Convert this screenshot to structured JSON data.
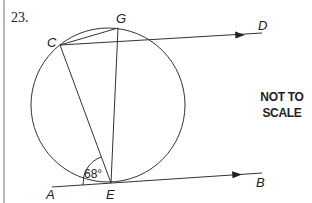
{
  "question": {
    "number": "23.",
    "note_line1": "NOT TO",
    "note_line2": "SCALE"
  },
  "diagram": {
    "circle": {
      "cx": 108,
      "cy": 105,
      "r": 77
    },
    "points": {
      "C": {
        "label": "C",
        "x": 60,
        "y": 45
      },
      "G": {
        "label": "G",
        "x": 118,
        "y": 28
      },
      "D": {
        "label": "D",
        "x": 262,
        "y": 33
      },
      "E": {
        "label": "E",
        "x": 111,
        "y": 183
      },
      "A": {
        "label": "A",
        "x": 52,
        "y": 187
      },
      "B": {
        "label": "B",
        "x": 262,
        "y": 173
      }
    },
    "angle": {
      "label": "68°",
      "vertex": "E",
      "between": [
        "A",
        "C"
      ]
    },
    "segments": [
      "C-G",
      "C-E",
      "G-E",
      "C-D",
      "A-B"
    ],
    "arrows": [
      "C-D",
      "E-B"
    ],
    "line_color": "#333333"
  }
}
